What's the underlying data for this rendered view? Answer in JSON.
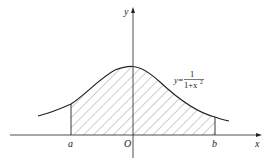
{
  "diagram": {
    "title": "",
    "axes": {
      "x_label": "x",
      "y_label": "y",
      "origin_label": "O"
    },
    "bounds": {
      "a_label": "a",
      "b_label": "b"
    },
    "curve": {
      "equation_prefix": "y=",
      "numerator": "1",
      "denominator": "1+x",
      "exponent": "2",
      "description": "y = 1/(1+x^2)"
    },
    "region": {
      "description": "Hatched area under curve between x=a and x=b",
      "fill": "diagonal hatching"
    },
    "colors": {
      "stroke": "#222222",
      "hatch": "#555555",
      "background": "#ffffff"
    }
  }
}
